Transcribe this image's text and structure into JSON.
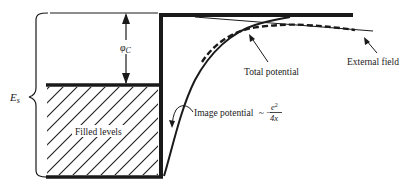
{
  "labels": {
    "work_function": "φ",
    "work_function_sub": "C",
    "fermi_energy": "E",
    "fermi_energy_sub": "s",
    "filled_levels": "Filled levels",
    "total_potential": "Total potential",
    "external_field": "External field",
    "image_potential": "Image potential",
    "image_formula_prefix": "~ −",
    "image_formula_num": "e",
    "image_formula_num_sup": "2",
    "image_formula_den": "4x"
  },
  "colors": {
    "ink": "#1a1a1a",
    "background": "#ffffff"
  }
}
